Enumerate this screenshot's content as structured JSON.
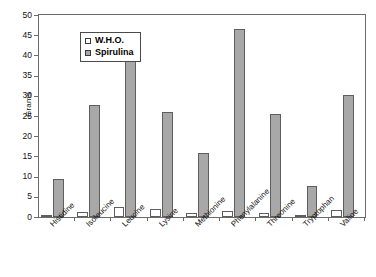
{
  "chart_data": {
    "type": "bar",
    "title": "",
    "xlabel": "",
    "ylabel": "Grams",
    "ylim": [
      0,
      50
    ],
    "ytick_step": 5,
    "yticks": [
      50,
      45,
      40,
      35,
      30,
      25,
      20,
      15,
      10,
      5,
      0
    ],
    "grid": false,
    "legend_position": "top-left-inside",
    "categories": [
      "Histidine",
      "Isoleucine",
      "Leucine",
      "Lysine",
      "Methionine",
      "Phenylalanine",
      "Threonine",
      "Tryptophan",
      "Valine"
    ],
    "series": [
      {
        "name": "W.H.O.",
        "color": "#ffffff",
        "values": [
          0.6,
          1.3,
          2.5,
          1.9,
          0.9,
          1.6,
          1.0,
          0.3,
          1.7
        ]
      },
      {
        "name": "Spirulina",
        "color": "#a8a8a8",
        "values": [
          9.3,
          27.8,
          42.8,
          26.1,
          15.8,
          46.5,
          25.6,
          7.8,
          30.3
        ]
      }
    ]
  },
  "legend": {
    "items": [
      {
        "label": "W.H.O.",
        "swatch": "who"
      },
      {
        "label": "Spirulina",
        "swatch": "spir"
      }
    ]
  },
  "axes": {
    "y_title": "Grams"
  }
}
